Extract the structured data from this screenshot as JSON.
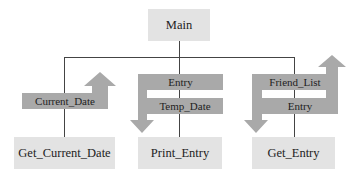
{
  "diagram": {
    "type": "structure-chart",
    "root": {
      "label": "Main"
    },
    "modules": [
      {
        "label": "Get_Current_Date",
        "data_flows": [
          {
            "label": "Current_Date",
            "direction": "up"
          }
        ]
      },
      {
        "label": "Print_Entry",
        "data_flows": [
          {
            "label": "Entry",
            "direction": "down"
          },
          {
            "label": "Temp_Date",
            "direction": "down"
          }
        ]
      },
      {
        "label": "Get_Entry",
        "data_flows": [
          {
            "label": "Friend_List",
            "direction": "down-and-up"
          },
          {
            "label": "Entry",
            "direction": "down-and-up"
          }
        ]
      }
    ],
    "colors": {
      "module_fill": "#e3e3e3",
      "flow_fill": "#a9a9a9",
      "line": "#444444"
    }
  }
}
